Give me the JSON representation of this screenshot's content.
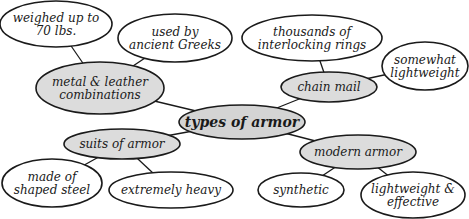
{
  "diagram": {
    "type": "concept-map",
    "central": {
      "id": "center",
      "label": "types of armor",
      "cx": 242,
      "cy": 122,
      "rx": 63,
      "ry": 17
    },
    "subtopics": [
      {
        "id": "metal",
        "label_lines": [
          "metal & leather",
          "combinations"
        ],
        "cx": 100,
        "cy": 88,
        "rx": 64,
        "ry": 26
      },
      {
        "id": "chain",
        "label_lines": [
          "chain mail"
        ],
        "cx": 329,
        "cy": 87,
        "rx": 48,
        "ry": 15
      },
      {
        "id": "suits",
        "label_lines": [
          "suits of armor"
        ],
        "cx": 122,
        "cy": 144,
        "rx": 58,
        "ry": 15
      },
      {
        "id": "modern",
        "label_lines": [
          "modern armor"
        ],
        "cx": 358,
        "cy": 152,
        "rx": 58,
        "ry": 17
      }
    ],
    "details": [
      {
        "id": "weighed",
        "parent": "metal",
        "label_lines": [
          "weighed up to",
          "70 lbs."
        ],
        "cx": 56,
        "cy": 24,
        "rx": 56,
        "ry": 23
      },
      {
        "id": "greeks",
        "parent": "metal",
        "label_lines": [
          "used by",
          "ancient Greeks"
        ],
        "cx": 175,
        "cy": 38,
        "rx": 57,
        "ry": 24
      },
      {
        "id": "rings",
        "parent": "chain",
        "label_lines": [
          "thousands of",
          "interlocking rings"
        ],
        "cx": 312,
        "cy": 38,
        "rx": 70,
        "ry": 23
      },
      {
        "id": "somewhat",
        "parent": "chain",
        "label_lines": [
          "somewhat",
          "lightweight"
        ],
        "cx": 425,
        "cy": 66,
        "rx": 43,
        "ry": 24
      },
      {
        "id": "steel",
        "parent": "suits",
        "label_lines": [
          "made of",
          "shaped steel"
        ],
        "cx": 52,
        "cy": 183,
        "rx": 50,
        "ry": 24
      },
      {
        "id": "heavy",
        "parent": "suits",
        "label_lines": [
          "extremely heavy"
        ],
        "cx": 171,
        "cy": 190,
        "rx": 62,
        "ry": 18
      },
      {
        "id": "synthetic",
        "parent": "modern",
        "label_lines": [
          "synthetic"
        ],
        "cx": 301,
        "cy": 190,
        "rx": 43,
        "ry": 17
      },
      {
        "id": "effective",
        "parent": "modern",
        "label_lines": [
          "lightweight &",
          "effective"
        ],
        "cx": 413,
        "cy": 195,
        "rx": 52,
        "ry": 23
      }
    ],
    "links": [
      [
        "center",
        "metal"
      ],
      [
        "center",
        "chain"
      ],
      [
        "center",
        "suits"
      ],
      [
        "center",
        "modern"
      ],
      [
        "metal",
        "weighed"
      ],
      [
        "metal",
        "greeks"
      ],
      [
        "chain",
        "rings"
      ],
      [
        "chain",
        "somewhat"
      ],
      [
        "suits",
        "steel"
      ],
      [
        "suits",
        "heavy"
      ],
      [
        "modern",
        "synthetic"
      ],
      [
        "modern",
        "effective"
      ]
    ],
    "colors": {
      "central_fill": "#d4d4d4",
      "subtopic_fill": "#dcdcdc",
      "detail_fill": "#ffffff",
      "stroke": "#1a1a1a"
    }
  }
}
